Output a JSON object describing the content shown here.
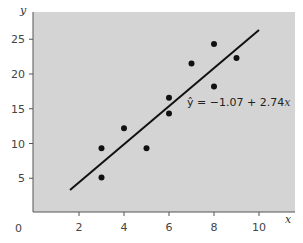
{
  "chart_data": {
    "type": "scatter",
    "title": "",
    "xlabel": "x",
    "ylabel": "y",
    "xlim": [
      0,
      11.5
    ],
    "ylim": [
      0,
      28.5
    ],
    "grid": false,
    "background": "#d4d4d4",
    "x_ticks": [
      2,
      4,
      6,
      8,
      10
    ],
    "y_ticks": [
      5,
      10,
      15,
      20,
      25
    ],
    "origin_label": "0",
    "points": [
      {
        "x": 3,
        "y": 9.3
      },
      {
        "x": 3,
        "y": 5.1
      },
      {
        "x": 4,
        "y": 12.2
      },
      {
        "x": 5,
        "y": 9.3
      },
      {
        "x": 6,
        "y": 16.6
      },
      {
        "x": 6,
        "y": 14.3
      },
      {
        "x": 7,
        "y": 21.5
      },
      {
        "x": 8,
        "y": 24.3
      },
      {
        "x": 8,
        "y": 18.2
      },
      {
        "x": 9,
        "y": 22.3
      }
    ],
    "regression": {
      "intercept": -1.07,
      "slope": 2.74,
      "x_start": 1.6,
      "x_end": 10,
      "label": "ŷ = −1.07 + 2.74x",
      "label_prefix": "ŷ = −1.07 + 2.74",
      "label_var": "x"
    }
  }
}
